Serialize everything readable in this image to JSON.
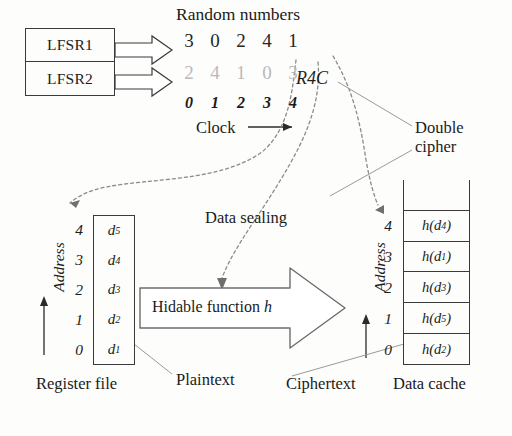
{
  "diagram": {
    "lfsr": {
      "items": [
        {
          "label": "LFSR1"
        },
        {
          "label": "LFSR2"
        }
      ]
    },
    "random_numbers": {
      "title": "Random numbers",
      "row_primary": [
        "3",
        "0",
        "2",
        "4",
        "1"
      ],
      "row_secondary": [
        "2",
        "4",
        "1",
        "0",
        "3"
      ],
      "clock_indices": [
        "0",
        "1",
        "2",
        "3",
        "4"
      ],
      "clock_label": "Clock",
      "primary_color": "#262626",
      "secondary_color": "#b9b9b9"
    },
    "annotations": {
      "r4c": "R4C",
      "double_cipher_line1": "Double",
      "double_cipher_line2": "cipher",
      "data_sealing": "Data sealing",
      "plaintext": "Plaintext",
      "ciphertext": "Ciphertext",
      "address_left": "Address",
      "address_right": "Address"
    },
    "register_file": {
      "caption": "Register file",
      "addresses": [
        "4",
        "3",
        "2",
        "1",
        "0"
      ],
      "values": [
        "d5",
        "d4",
        "d3",
        "d2",
        "d1"
      ],
      "value_base": [
        "d",
        "d",
        "d",
        "d",
        "d"
      ],
      "value_sub": [
        "5",
        "4",
        "3",
        "2",
        "1"
      ]
    },
    "hidable_function": {
      "text": "Hidable function",
      "symbol": "h"
    },
    "data_cache": {
      "caption": "Data cache",
      "addresses": [
        "4",
        "3",
        "2",
        "1",
        "0"
      ],
      "cells": [
        {
          "fn": "h",
          "arg_base": "d",
          "arg_sub": "4"
        },
        {
          "fn": "h",
          "arg_base": "d",
          "arg_sub": "1"
        },
        {
          "fn": "h",
          "arg_base": "d",
          "arg_sub": "3"
        },
        {
          "fn": "h",
          "arg_base": "d",
          "arg_sub": "5"
        },
        {
          "fn": "h",
          "arg_base": "d",
          "arg_sub": "2"
        }
      ]
    },
    "colors": {
      "stroke": "#3a3a3a",
      "dotted": "#8a8a8a",
      "leader": "#9a9a9a"
    }
  }
}
